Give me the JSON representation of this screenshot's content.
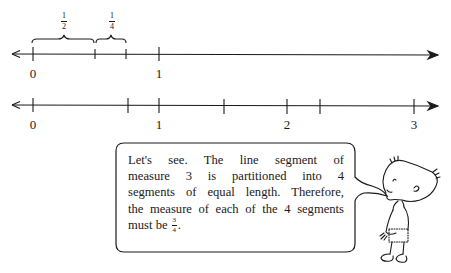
{
  "figure": {
    "number_line_1": {
      "description": "Number line showing 1/2 + 1/4 from 0",
      "tick_labels": [
        {
          "value": 0,
          "label": "0"
        },
        {
          "value": 1,
          "label": "1"
        }
      ],
      "unlabeled_ticks": [
        0.5,
        0.75
      ],
      "braces": [
        {
          "from": 0,
          "to": 0.5,
          "label_num": "1",
          "label_den": "2"
        },
        {
          "from": 0.5,
          "to": 0.75,
          "label_num": "1",
          "label_den": "4"
        }
      ]
    },
    "number_line_2": {
      "description": "Number line from 0 to 3 partitioned into 4 equal segments",
      "tick_labels": [
        {
          "value": 0,
          "label": "0"
        },
        {
          "value": 1,
          "label": "1"
        },
        {
          "value": 2,
          "label": "2"
        },
        {
          "value": 3,
          "label": "3"
        }
      ],
      "unlabeled_ticks": [
        0.75,
        1.5,
        2.25
      ]
    },
    "speech_bubble": {
      "lines": [
        "Let's see. The line segment of",
        "measure 3 is partitioned into 4",
        "segments of equal length. Therefore,",
        "the measure of each of the 4 segments"
      ],
      "last_line_prefix": "must be",
      "last_line_frac_num": "3",
      "last_line_frac_den": "4",
      "last_line_suffix": "."
    },
    "character": "cartoon boy speaking"
  }
}
